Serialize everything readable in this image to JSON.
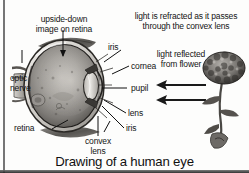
{
  "figure": {
    "caption": "Drawing of a human eye",
    "background_color": "#fdfdfc",
    "ink_color": "#141414",
    "style": "grayscale halftone scientific illustration"
  },
  "annotations": {
    "upside_down_image": "upside-down\nimage on retina",
    "optic_nerve": "optic\nnerve",
    "retina": "retina",
    "iris_top": "iris",
    "cornea": "cornea",
    "pupil": "pupil",
    "lens": "lens",
    "iris_bottom": "iris",
    "convex_lens": "convex\nlens",
    "refraction_note": "light is refracted as it passes\nthrough the convex lens",
    "reflected_light": "light reflected\nfrom flower"
  },
  "diagram_objects": {
    "eyeball": "eyeball-illustration",
    "flower": "flower-illustration",
    "light_ray_arrows": 2,
    "arrow_direction": "left"
  }
}
